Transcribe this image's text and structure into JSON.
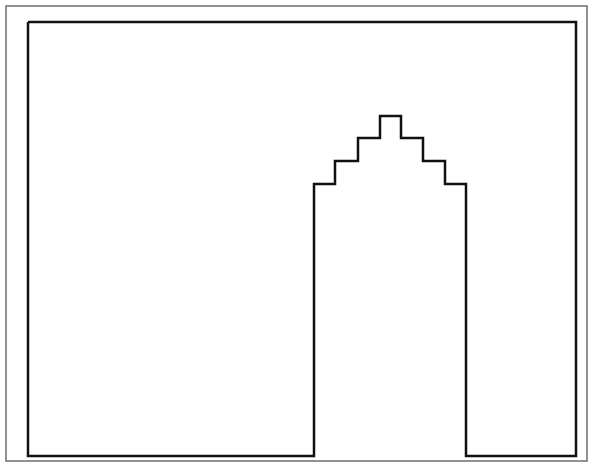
{
  "diagram": {
    "canvas": {
      "width": 589,
      "height": 471,
      "background": "#ffffff"
    },
    "outer_frame": {
      "x1": 6,
      "y1": 6,
      "x2": 587,
      "y2": 461,
      "stroke": "#6e6e6e",
      "stroke_width": 1.5
    },
    "shape": {
      "stroke": "#111111",
      "stroke_width": 2.5,
      "points": "28,22 576,22 576,456 466,456 466,184 445,184 445,161 423,161 423,138 401,138 401,116 380,116 380,138 358,138 358,161 335,161 335,184 314,184 314,456 28,456 28,22"
    }
  }
}
